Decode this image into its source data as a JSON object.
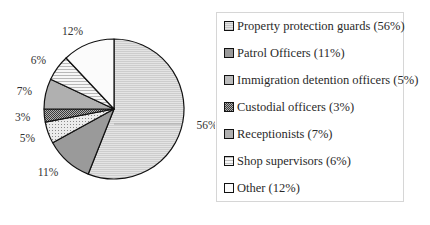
{
  "chart_data": {
    "type": "pie",
    "title": "",
    "start_angle_deg": -90,
    "direction": "clockwise",
    "categories": [
      "Property protection guards",
      "Patrol Officers",
      "Immigration detention officers",
      "Custodial  officers",
      "Receptionists",
      "Shop supervisors",
      "Other"
    ],
    "values": [
      56,
      11,
      5,
      3,
      7,
      6,
      12
    ],
    "data_labels": [
      "56%",
      "11%",
      "5%",
      "3%",
      "7%",
      "6%",
      "12%"
    ],
    "legend_position": "right",
    "fills": [
      {
        "base": "#c9c9c9",
        "pattern": "hlines",
        "line": "#e6e6e6"
      },
      {
        "base": "#9a9a9a",
        "pattern": "solid",
        "line": "#9a9a9a"
      },
      {
        "base": "#e8e8e8",
        "pattern": "dots",
        "line": "#9a9a9a"
      },
      {
        "base": "#8a8a8a",
        "pattern": "checker",
        "line": "#4a4a4a"
      },
      {
        "base": "#b0b0b0",
        "pattern": "solid",
        "line": "#b0b0b0"
      },
      {
        "base": "#f4f4f4",
        "pattern": "hlines",
        "line": "#bdbdbd"
      },
      {
        "base": "#fbfbfb",
        "pattern": "solid",
        "line": "#fbfbfb"
      }
    ]
  },
  "legend": {
    "items": [
      {
        "label": "Property protection guards (56%)"
      },
      {
        "label": "Patrol Officers (11%)"
      },
      {
        "label": "Immigration detention officers (5%)"
      },
      {
        "label": "Custodial  officers (3%)"
      },
      {
        "label": "Receptionists (7%)"
      },
      {
        "label": "Shop supervisors (6%)"
      },
      {
        "label": "Other (12%)"
      }
    ]
  }
}
